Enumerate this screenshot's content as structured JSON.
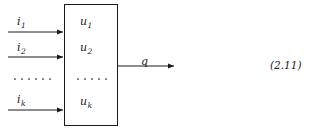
{
  "figure": {
    "type": "block-diagram",
    "background_color": "#ffffff",
    "stroke_color": "#1a1a1a",
    "text_color": "#1a1a1a",
    "equation_number": "(2.11)",
    "block": {
      "label": "processing-block",
      "interior_labels": [
        {
          "base": "u",
          "sub": "1"
        },
        {
          "base": "u",
          "sub": "2"
        },
        {
          "base": "u",
          "sub": "k"
        }
      ],
      "interior_ellipsis_dots": 5
    },
    "inputs": [
      {
        "base": "i",
        "sub": "1"
      },
      {
        "base": "i",
        "sub": "2"
      },
      {
        "base": "i",
        "sub": "k"
      }
    ],
    "input_ellipsis_dots": 6,
    "outputs": [
      {
        "base": "q",
        "sub": ""
      }
    ]
  }
}
